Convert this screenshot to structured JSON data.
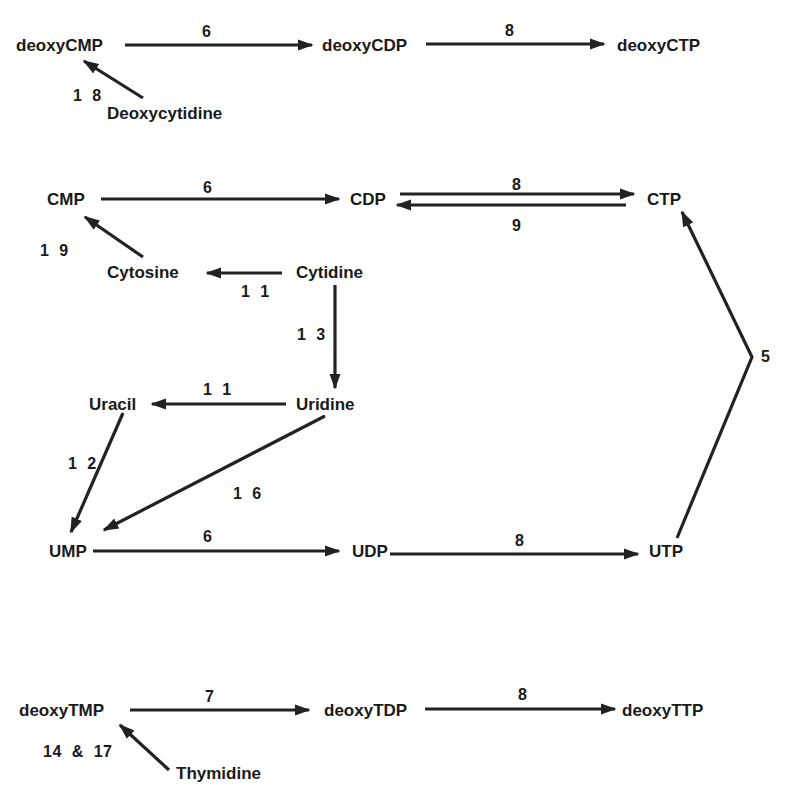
{
  "nodes": {
    "deoxyCMP": "deoxyCMP",
    "deoxyCDP": "deoxyCDP",
    "deoxyCTP": "deoxyCTP",
    "Deoxycytidine": "Deoxycytidine",
    "CMP": "CMP",
    "CDP": "CDP",
    "CTP": "CTP",
    "Cytosine": "Cytosine",
    "Cytidine": "Cytidine",
    "Uracil": "Uracil",
    "Uridine": "Uridine",
    "UMP": "UMP",
    "UDP": "UDP",
    "UTP": "UTP",
    "deoxyTMP": "deoxyTMP",
    "deoxyTDP": "deoxyTDP",
    "deoxyTTP": "deoxyTTP",
    "Thymidine": "Thymidine"
  },
  "reactions": {
    "dCMP_to_dCDP": "6",
    "dCDP_to_dCTP": "8",
    "dCyd_to_dCMP": "1 8",
    "CMP_to_CDP": "6",
    "CDP_to_CTP": "8",
    "CTP_to_CDP": "9",
    "Cytosine_to_CMP": "1 9",
    "Cytidine_to_Cytosine": "1 1",
    "Cytidine_to_Uridine": "1 3",
    "Uridine_to_Uracil": "1 1",
    "Uracil_to_UMP": "1 2",
    "Uridine_to_UMP": "1 6",
    "UTP_to_CTP": "5",
    "UMP_to_UDP": "6",
    "UDP_to_UTP": "8",
    "dTMP_to_dTDP": "7",
    "dTDP_to_dTTP": "8",
    "Thd_to_dTMP": "14  &  17"
  },
  "colors": {
    "ink": "#1a1a1a",
    "background": "#ffffff"
  }
}
